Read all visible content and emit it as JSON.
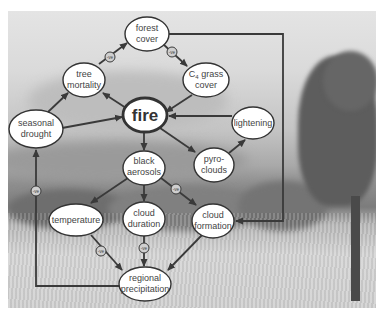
{
  "diagram": {
    "central_node": "fire",
    "nodes": {
      "forest_cover": [
        "forest",
        "cover"
      ],
      "tree_mortality": [
        "tree",
        "mortality"
      ],
      "c4_grass_cover": [
        "C",
        "4",
        " grass",
        "cover"
      ],
      "seasonal_drought": [
        "seasonal",
        "drought"
      ],
      "fire": "fire",
      "lightening": "lightening",
      "black_aerosols": [
        "black",
        "aerosols"
      ],
      "pyro_clouds": [
        "pyro-",
        "clouds"
      ],
      "temperature": "temperature",
      "cloud_duration": [
        "cloud",
        "duration"
      ],
      "cloud_formation": [
        "cloud",
        "formation"
      ],
      "regional_precipitation": [
        "regional",
        "precipitation"
      ]
    },
    "negative_badge_label": "-ve",
    "edges": [
      {
        "from": "seasonal drought",
        "to": "tree mortality",
        "sign": "+"
      },
      {
        "from": "seasonal drought",
        "to": "fire",
        "sign": "+"
      },
      {
        "from": "tree mortality",
        "to": "forest cover",
        "sign": "-ve"
      },
      {
        "from": "forest cover",
        "to": "C4 grass cover",
        "sign": "-ve"
      },
      {
        "from": "forest cover",
        "to": "cloud formation",
        "sign": "+"
      },
      {
        "from": "C4 grass cover",
        "to": "fire",
        "sign": "+"
      },
      {
        "from": "fire",
        "to": "tree mortality",
        "sign": "+"
      },
      {
        "from": "lightening",
        "to": "fire",
        "sign": "+"
      },
      {
        "from": "fire",
        "to": "black aerosols",
        "sign": "+"
      },
      {
        "from": "fire",
        "to": "pyro-clouds",
        "sign": "+"
      },
      {
        "from": "pyro-clouds",
        "to": "lightening",
        "sign": "+"
      },
      {
        "from": "black aerosols",
        "to": "temperature",
        "sign": "+"
      },
      {
        "from": "black aerosols",
        "to": "cloud duration",
        "sign": "+"
      },
      {
        "from": "black aerosols",
        "to": "cloud formation",
        "sign": "-ve"
      },
      {
        "from": "temperature",
        "to": "regional precipitation",
        "sign": "-ve"
      },
      {
        "from": "cloud duration",
        "to": "regional precipitation",
        "sign": "-ve"
      },
      {
        "from": "cloud formation",
        "to": "regional precipitation",
        "sign": "+"
      },
      {
        "from": "regional precipitation",
        "to": "seasonal drought",
        "sign": "-ve"
      }
    ],
    "colors": {
      "line": "#3a3a3a",
      "node_fill": "#ffffff",
      "node_stroke": "#333333",
      "badge_fill": "#d0d0d0"
    }
  }
}
